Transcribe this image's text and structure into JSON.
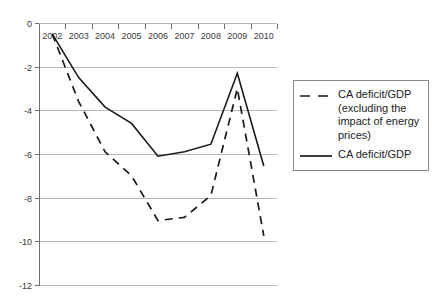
{
  "chart_data": {
    "type": "line",
    "title": "",
    "xlabel": "",
    "ylabel": "",
    "categories": [
      "2002",
      "2003",
      "2004",
      "2005",
      "2006",
      "2007",
      "2008",
      "2009",
      "2010"
    ],
    "x": [
      2002,
      2003,
      2004,
      2005,
      2006,
      2007,
      2008,
      2009,
      2010
    ],
    "ylim": [
      -12,
      0
    ],
    "yticks": [
      0,
      -2,
      -4,
      -6,
      -8,
      -10,
      -12
    ],
    "ytick_labels": [
      "0",
      "-2",
      "-4",
      "-6",
      "-8",
      "-10",
      "-12"
    ],
    "grid": true,
    "legend_position": "right",
    "series": [
      {
        "name": "CA deficit/GDP (excluding the impact of energy prices)",
        "style": "dashed",
        "color": "#1a1a1a",
        "values": [
          -0.5,
          -3.6,
          -5.9,
          -7.0,
          -9.05,
          -8.9,
          -7.9,
          -3.0,
          -9.75
        ]
      },
      {
        "name": "CA deficit/GDP",
        "style": "solid",
        "color": "#1a1a1a",
        "values": [
          -0.5,
          -2.5,
          -3.85,
          -4.6,
          -6.1,
          -5.9,
          -5.55,
          -2.3,
          -6.55
        ]
      }
    ]
  },
  "legend": {
    "entries": [
      {
        "marker": "dashed-line-icon",
        "label": "CA deficit/GDP (excluding the impact of energy prices)"
      },
      {
        "marker": "solid-line-icon",
        "label": "CA deficit/GDP"
      }
    ]
  }
}
